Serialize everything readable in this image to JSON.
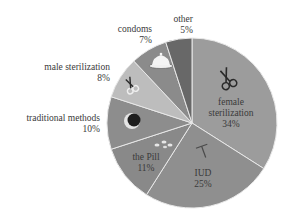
{
  "chart_data": {
    "type": "pie",
    "title": "",
    "start_angle": "12 o'clock, clockwise",
    "categories": [
      "female sterilization",
      "IUD",
      "the Pill",
      "traditional methods",
      "male sterilization",
      "condoms",
      "other"
    ],
    "values": [
      34,
      25,
      11,
      10,
      8,
      7,
      5
    ],
    "unit": "%",
    "colors": [
      "#9c9c9c",
      "#8f8f8f",
      "#898989",
      "#8d8d8d",
      "#bdbdbd",
      "#8b8b8b",
      "#686868"
    ],
    "slice_icons": [
      "scissors-icon",
      "iud-icon",
      "pills-icon",
      "moon-icon",
      "scissors-icon",
      "condom-icon",
      null
    ],
    "legend": "none (labels placed on/near slices)"
  },
  "labels": {
    "female_sterilization": {
      "name1": "female",
      "name2": "sterilization",
      "pct": "34%"
    },
    "iud": {
      "name": "IUD",
      "pct": "25%"
    },
    "pill": {
      "name": "the Pill",
      "pct": "11%"
    },
    "traditional": {
      "name": "traditional methods",
      "pct": "10%"
    },
    "male_sterilization": {
      "name": "male sterilization",
      "pct": "8%"
    },
    "condoms": {
      "name": "condoms",
      "pct": "7%"
    },
    "other": {
      "name": "other",
      "pct": "5%"
    }
  }
}
